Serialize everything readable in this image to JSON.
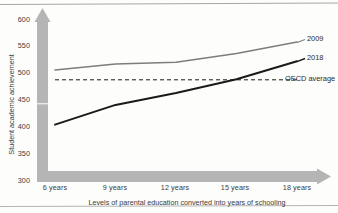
{
  "chart_data": {
    "type": "line",
    "title": "",
    "xlabel": "Levels of parental education converted into years of schooling",
    "ylabel": "Student academic achievement",
    "categories": [
      "6 years",
      "9 years",
      "12 years",
      "15 years",
      "18 years"
    ],
    "x": [
      6,
      9,
      12,
      15,
      18
    ],
    "xlim": [
      6,
      18
    ],
    "ylim": [
      300,
      600
    ],
    "yticks": [
      300,
      350,
      400,
      450,
      500,
      550,
      600
    ],
    "grid": false,
    "legend_position": "right-inline",
    "series": [
      {
        "name": "2009",
        "color": "#7d7d7d",
        "style": "solid",
        "values": [
          505,
          516,
          519,
          535,
          556
        ]
      },
      {
        "name": "2018",
        "color": "#1a1a1a",
        "style": "solid",
        "values": [
          405,
          441,
          463,
          488,
          521
        ]
      },
      {
        "name": "OECD average",
        "color": "#1a1a1a",
        "style": "dashed",
        "values": [
          487,
          487,
          487,
          487,
          487
        ]
      }
    ]
  },
  "axes": {
    "y_title": "Student academic achievement",
    "x_title": "Levels of parental education converted into years of schooling",
    "y_ticks": [
      "600",
      "550",
      "500",
      "450",
      "400",
      "350",
      "300"
    ],
    "x_ticks": [
      "6 years",
      "9 years",
      "12 years",
      "15 years",
      "18 years"
    ]
  },
  "legend": {
    "series_2009": "2009",
    "series_2018": "2018",
    "oecd_average": "OECD average"
  },
  "colors": {
    "series_2009": "#7d7d7d",
    "series_2018": "#1a1a1a",
    "oecd_average": "#1a1a1a",
    "axis_arrow": "#b5b5b5",
    "background": "#fdfdfb"
  }
}
